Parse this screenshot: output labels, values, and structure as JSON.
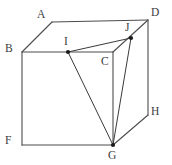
{
  "figure": {
    "kind": "cube-with-inscribed-triangle",
    "background_color": "#ffffff",
    "line_color": "#4d4d4d",
    "label_color": "#3c3c3c",
    "marked_point_color": "#1a1a1a",
    "canvas": {
      "width": 172,
      "height": 165
    },
    "vertices": [
      {
        "name": "A",
        "label": "A",
        "x": 52,
        "y": 22,
        "label_x": 37,
        "label_y": 9,
        "marked": false
      },
      {
        "name": "B",
        "label": "B",
        "x": 22,
        "y": 52,
        "label_x": 5,
        "label_y": 43,
        "marked": false
      },
      {
        "name": "C",
        "label": "C",
        "x": 113,
        "y": 52,
        "label_x": 101,
        "label_y": 56,
        "marked": false
      },
      {
        "name": "D",
        "label": "D",
        "x": 148,
        "y": 20,
        "label_x": 151,
        "label_y": 7,
        "marked": false
      },
      {
        "name": "F",
        "label": "F",
        "x": 22,
        "y": 145,
        "label_x": 5,
        "label_y": 135,
        "marked": false
      },
      {
        "name": "G",
        "label": "G",
        "x": 113,
        "y": 145,
        "label_x": 108,
        "label_y": 150,
        "marked": true
      },
      {
        "name": "H",
        "label": "H",
        "x": 148,
        "y": 115,
        "label_x": 151,
        "label_y": 106,
        "marked": false
      },
      {
        "name": "I",
        "label": "I",
        "x": 68,
        "y": 52,
        "label_x": 64,
        "label_y": 36,
        "marked": true
      },
      {
        "name": "J",
        "label": "J",
        "x": 131,
        "y": 38,
        "label_x": 125,
        "label_y": 22,
        "marked": true
      }
    ],
    "cube_edges": [
      {
        "name": "edge-A-D",
        "from": "A",
        "to": "D"
      },
      {
        "name": "edge-A-B",
        "from": "A",
        "to": "B"
      },
      {
        "name": "edge-B-C",
        "from": "B",
        "to": "C"
      },
      {
        "name": "edge-C-D",
        "from": "C",
        "to": "D"
      },
      {
        "name": "edge-B-F",
        "from": "B",
        "to": "F"
      },
      {
        "name": "edge-F-G",
        "from": "F",
        "to": "G"
      },
      {
        "name": "edge-G-H",
        "from": "G",
        "to": "H"
      },
      {
        "name": "edge-D-H",
        "from": "D",
        "to": "H"
      },
      {
        "name": "edge-C-G",
        "from": "C",
        "to": "G"
      }
    ],
    "triangle_edges": [
      {
        "name": "segment-I-J",
        "from": "I",
        "to": "J"
      },
      {
        "name": "segment-J-G",
        "from": "J",
        "to": "G"
      },
      {
        "name": "segment-I-G",
        "from": "I",
        "to": "G"
      }
    ]
  }
}
